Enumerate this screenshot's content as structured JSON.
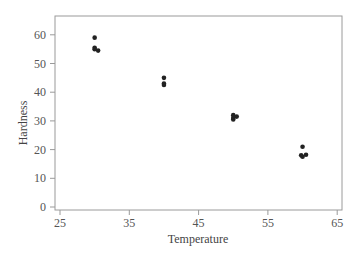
{
  "chart_data": {
    "type": "scatter",
    "title": "",
    "xlabel": "Temperature",
    "ylabel": "Hardness",
    "xlim": [
      23,
      66
    ],
    "ylim": [
      -1,
      66
    ],
    "x_ticks": [
      25,
      35,
      45,
      55,
      65
    ],
    "y_ticks": [
      0,
      10,
      20,
      30,
      40,
      50,
      60
    ],
    "grid": false,
    "legend": null,
    "series": [
      {
        "name": "Hardness",
        "color": "#222222",
        "points": [
          {
            "x": 30,
            "y": 59
          },
          {
            "x": 30,
            "y": 55.5
          },
          {
            "x": 30,
            "y": 55
          },
          {
            "x": 30.5,
            "y": 54.5
          },
          {
            "x": 40,
            "y": 45
          },
          {
            "x": 40,
            "y": 43
          },
          {
            "x": 40,
            "y": 42.5
          },
          {
            "x": 50,
            "y": 32
          },
          {
            "x": 50,
            "y": 31
          },
          {
            "x": 50.5,
            "y": 31.5
          },
          {
            "x": 50,
            "y": 30.5
          },
          {
            "x": 60,
            "y": 21
          },
          {
            "x": 59.8,
            "y": 18
          },
          {
            "x": 60,
            "y": 17.5
          },
          {
            "x": 60.5,
            "y": 18.2
          }
        ]
      }
    ]
  },
  "labels": {
    "xlabel": "Temperature",
    "ylabel": "Hardness",
    "x_ticks": [
      "25",
      "35",
      "45",
      "55",
      "65"
    ],
    "y_ticks": [
      "0",
      "10",
      "20",
      "30",
      "40",
      "50",
      "60"
    ]
  }
}
